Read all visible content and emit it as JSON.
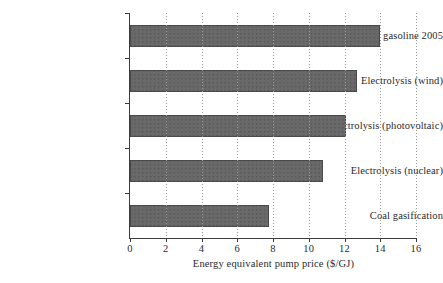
{
  "chart_data": {
    "type": "bar",
    "orientation": "horizontal",
    "title": "",
    "xlabel": "Energy equivalent pump price ($/GJ)",
    "ylabel": "",
    "xlim": [
      0,
      16
    ],
    "xticks": [
      "0",
      "2",
      "4",
      "6",
      "8",
      "10",
      "12",
      "14",
      "16"
    ],
    "grid": "vertical-dotted",
    "legend": "none",
    "categories": [
      "U.S. gasoline 2005",
      "Electrolysis (wind)",
      "Electrolysis (photovoltaic)",
      "Electrolysis (nuclear)",
      "Coal gasification"
    ],
    "values": [
      14.0,
      12.7,
      12.1,
      10.8,
      7.8
    ],
    "bar_fill": "#4f4f4f",
    "bar_edge": "#4a4a4a",
    "axis_color": "#3b3b3b",
    "grid_color": "#9a9a9a"
  }
}
